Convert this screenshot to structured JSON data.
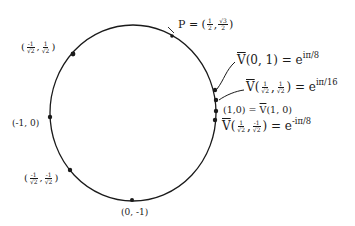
{
  "diagram": {
    "type": "unit-circle",
    "stroke_color": "#1a1a1a",
    "background_color": "#ffffff",
    "circle": {
      "cx": 133,
      "cy": 113,
      "rx": 83,
      "ry": 88
    }
  },
  "points": [
    {
      "id": "p",
      "x": 172,
      "y": 36,
      "label_prefix": "P =",
      "coords": [
        "1/2",
        "√3/2"
      ]
    },
    {
      "id": "q2",
      "x": 72,
      "y": 54,
      "coords": [
        "-1/√2",
        "1/√2"
      ]
    },
    {
      "id": "neg1_0",
      "x": 50,
      "y": 117,
      "label": "(-1, 0)"
    },
    {
      "id": "q3",
      "x": 70,
      "y": 170,
      "coords": [
        "-1/√2",
        "-1/√2"
      ]
    },
    {
      "id": "0_neg1",
      "x": 132,
      "y": 200,
      "label": "(0, -1)"
    },
    {
      "id": "v01",
      "x": 215,
      "y": 90,
      "label_left": "V̄(0,1) = e",
      "exponent": "iπ/8"
    },
    {
      "id": "vq1",
      "x": 216,
      "y": 100,
      "label_left": "V̄(1/√2, 1/√2) = e",
      "exponent": "iπ/16"
    },
    {
      "id": "one_zero",
      "x": 216,
      "y": 110,
      "label": "(1,0) = V̄(1,0)"
    },
    {
      "id": "vq4",
      "x": 215,
      "y": 120,
      "label_left": "V̄(1/√2, -1/√2) = e",
      "exponent": "-iπ/8"
    }
  ],
  "labels": {
    "p": {
      "prefix": "P = (",
      "num1": "1",
      "den1": "2",
      "num2": "√3",
      "den2": "2",
      "suffix": ")"
    },
    "q2": {
      "open": "(",
      "num1": "-1",
      "den1": "√2",
      "sep": ",",
      "num2": "1",
      "den2": "√2",
      "close": ")"
    },
    "neg1_0": "(-1, 0)",
    "q3": {
      "open": "(",
      "num1": "-1",
      "den1": "√2",
      "sep": ",",
      "num2": "-1",
      "den2": "√2",
      "close": ")"
    },
    "zero_neg1": "(0, -1)",
    "v01": {
      "head": "V",
      "args": "(0, 1) = e",
      "exp": "iπ/8"
    },
    "vq1": {
      "head": "V",
      "open": "(",
      "num1": "1",
      "den1": "√2",
      "sep": ",",
      "num2": "1",
      "den2": "√2",
      "close": ") = e",
      "exp": "iπ/16"
    },
    "one_zero": {
      "text": "(1,0) = ",
      "head": "V",
      "args": "(1, 0)"
    },
    "vq4": {
      "head": "V",
      "open": "(",
      "num1": "1",
      "den1": "√2",
      "sep": ",",
      "num2": "-1",
      "den2": "√2",
      "close": ") = e",
      "exp": "-iπ/8"
    }
  }
}
